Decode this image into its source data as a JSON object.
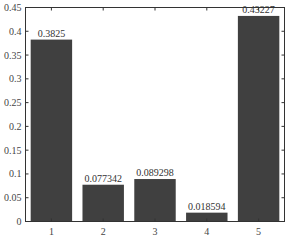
{
  "chart_data": {
    "type": "bar",
    "title": "",
    "xlabel": "",
    "ylabel": "",
    "categories": [
      "1",
      "2",
      "3",
      "4",
      "5"
    ],
    "values": [
      0.3825,
      0.077342,
      0.089298,
      0.018594,
      0.43227
    ],
    "data_labels": [
      "0.3825",
      "0.077342",
      "0.089298",
      "0.018594",
      "0.43227"
    ],
    "ylim": [
      0,
      0.45
    ],
    "yticks": [
      0,
      0.05,
      0.1,
      0.15,
      0.2,
      0.25,
      0.3,
      0.35,
      0.4,
      0.45
    ],
    "ytick_labels": [
      "0",
      "0.05",
      "0.1",
      "0.15",
      "0.2",
      "0.25",
      "0.3",
      "0.35",
      "0.4",
      "0.45"
    ],
    "grid": false,
    "legend": null,
    "bar_color": "#404040"
  }
}
